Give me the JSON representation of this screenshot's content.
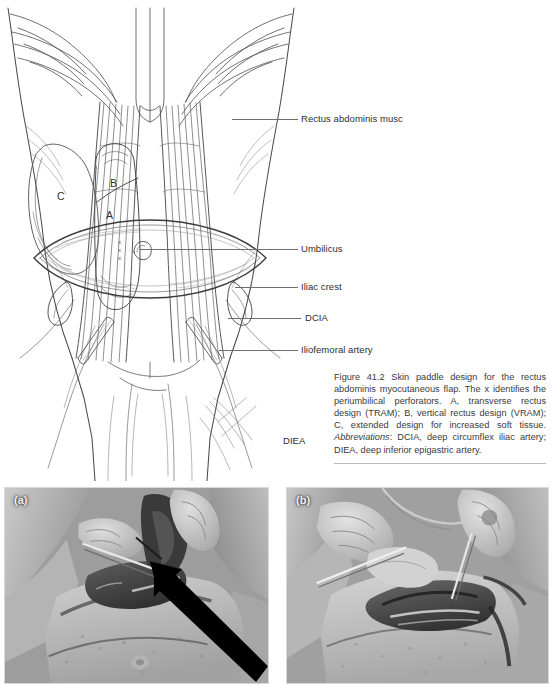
{
  "figure": {
    "number": "41.2",
    "illustration_callouts": [
      {
        "id": "rectus",
        "label": "Rectus abdominis musc"
      },
      {
        "id": "umbilicus",
        "label": "Umbilicus"
      },
      {
        "id": "iliac",
        "label": "Iliac crest"
      },
      {
        "id": "dcia",
        "label": "DCIA"
      },
      {
        "id": "iliofem",
        "label": "Iliofemoral artery"
      },
      {
        "id": "diea",
        "label": "DIEA"
      }
    ],
    "region_letters": [
      {
        "id": "a",
        "label": "A"
      },
      {
        "id": "b",
        "label": "B"
      },
      {
        "id": "c",
        "label": "C"
      }
    ],
    "perforator_marks": [
      {
        "id": "x1",
        "label": "x"
      },
      {
        "id": "x2",
        "label": "x"
      },
      {
        "id": "x3",
        "label": "x"
      }
    ],
    "caption": {
      "lead": "Figure 41.2 Skin paddle design for the rectus abdominis myocutaneous flap. The x identifies the periumbilical perforators. A, transverse rectus design (TRAM); B, vertical rectus design (VRAM); C, extended design for increased soft tissue. ",
      "abbrev_heading": "Abbreviations",
      "abbrev_body": ": DCIA, deep circumflex iliac artery; DIEA, deep inferior epigastric artery."
    }
  },
  "photos": [
    {
      "id": "a",
      "label": "(a)",
      "has_arrow": true
    },
    {
      "id": "b",
      "label": "(b)",
      "has_arrow": false
    }
  ],
  "colors": {
    "ink": "#3a3a3a",
    "line": "#6e6e6e",
    "rule": "#b9b9b9",
    "panel_label": "#f2f2f2"
  }
}
